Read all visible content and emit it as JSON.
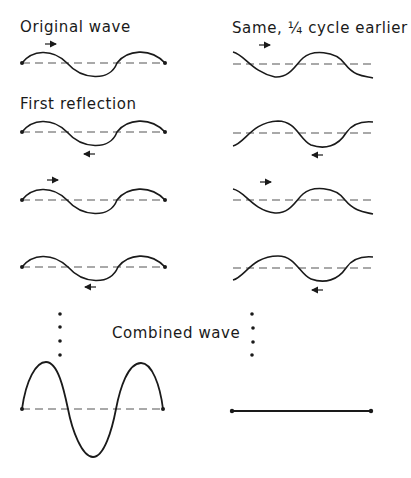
{
  "labels": {
    "original": "Original wave",
    "shifted": "Same, ¼ cycle earlier",
    "first_reflection": "First reflection",
    "combined": "Combined wave"
  },
  "colors": {
    "ink": "#1a1a1a",
    "dashed_axis": "#555555",
    "background": "#ffffff"
  },
  "left_column": {
    "rows": [
      {
        "id": "original",
        "arrow": "right",
        "arrow_position": "above",
        "phase": "sine-up-start"
      },
      {
        "id": "reflection-1",
        "arrow": "left",
        "arrow_position": "below",
        "phase": "sine-up-start"
      },
      {
        "id": "reflection-2",
        "arrow": "right",
        "arrow_position": "above",
        "phase": "sine-up-start"
      },
      {
        "id": "reflection-3",
        "arrow": "left",
        "arrow_position": "below",
        "phase": "sine-up-start"
      }
    ],
    "combined": {
      "type": "standing-wave",
      "amplitude": "large",
      "fixed_endpoints": true
    }
  },
  "right_column": {
    "rows": [
      {
        "id": "shifted-original",
        "arrow": "right",
        "arrow_position": "above",
        "phase": "cosine"
      },
      {
        "id": "shifted-reflection-1",
        "arrow": "left",
        "arrow_position": "below",
        "phase": "negative-cosine"
      },
      {
        "id": "shifted-reflection-2",
        "arrow": "right",
        "arrow_position": "above",
        "phase": "cosine"
      },
      {
        "id": "shifted-reflection-3",
        "arrow": "left",
        "arrow_position": "below",
        "phase": "negative-cosine"
      }
    ],
    "combined": {
      "type": "flat-line",
      "amplitude": 0,
      "fixed_endpoints": true
    }
  },
  "ellipsis": {
    "dots_per_column": 4
  }
}
